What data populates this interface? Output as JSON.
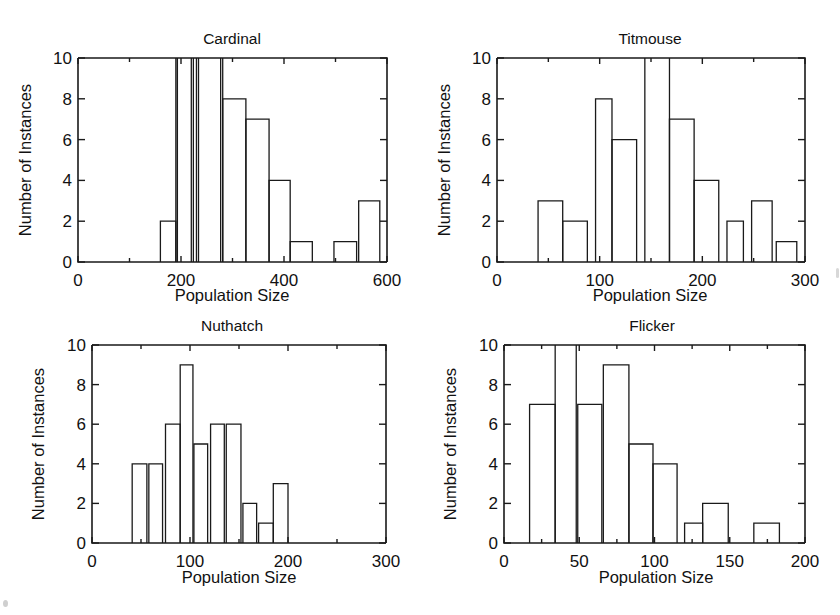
{
  "figure": {
    "background": "#ffffff",
    "ink_color": "#1a1a1a",
    "panel_count": 4,
    "layout": "2x2 grid of histograms"
  },
  "common": {
    "xlabel": "Population Size",
    "ylabel": "Number of Instances",
    "y_ticks": [
      "0",
      "2",
      "4",
      "6",
      "8",
      "10"
    ],
    "y_tick_values": [
      0,
      2,
      4,
      6,
      8,
      10
    ],
    "ylim": [
      0,
      10
    ]
  },
  "panels": [
    {
      "id": "cardinal",
      "title": "Cardinal",
      "x_ticks": [
        "0",
        "200",
        "400",
        "600"
      ],
      "x_tick_values": [
        0,
        200,
        400,
        600
      ]
    },
    {
      "id": "titmouse",
      "title": "Titmouse",
      "x_ticks": [
        "0",
        "100",
        "200",
        "300"
      ],
      "x_tick_values": [
        0,
        100,
        200,
        300
      ]
    },
    {
      "id": "nuthatch",
      "title": "Nuthatch",
      "x_ticks": [
        "0",
        "100",
        "200",
        "300"
      ],
      "x_tick_values": [
        0,
        100,
        200,
        300
      ]
    },
    {
      "id": "flicker",
      "title": "Flicker",
      "x_ticks": [
        "0",
        "50",
        "100",
        "150",
        "200"
      ],
      "x_tick_values": [
        0,
        50,
        100,
        150,
        200
      ]
    }
  ],
  "chart_data": [
    {
      "type": "bar",
      "id": "cardinal",
      "title": "Cardinal",
      "xlabel": "Population Size",
      "ylabel": "Number of Instances",
      "xlim": [
        0,
        600
      ],
      "ylim": [
        0,
        10
      ],
      "grid": false,
      "legend": null,
      "note": "Histogram; several bars exceed the y-axis limit of 10 and are clipped at the top of the axes.",
      "bin_edges": [
        160,
        190,
        220,
        230,
        250,
        280,
        310,
        340,
        370,
        400,
        430,
        460,
        520,
        550,
        580
      ],
      "bars": [
        {
          "x0": 160,
          "x1": 190,
          "value": 2,
          "clipped": false
        },
        {
          "x0": 190,
          "x1": 193,
          "value": 10,
          "clipped": true
        },
        {
          "x0": 220,
          "x1": 224,
          "value": 10,
          "clipped": true
        },
        {
          "x0": 230,
          "x1": 234,
          "value": 10,
          "clipped": true
        },
        {
          "x0": 277,
          "x1": 281,
          "value": 10,
          "clipped": true
        },
        {
          "x0": 281,
          "x1": 326,
          "value": 8,
          "clipped": false
        },
        {
          "x0": 326,
          "x1": 371,
          "value": 7,
          "clipped": false
        },
        {
          "x0": 371,
          "x1": 412,
          "value": 4,
          "clipped": false
        },
        {
          "x0": 412,
          "x1": 455,
          "value": 1,
          "clipped": false
        },
        {
          "x0": 497,
          "x1": 541,
          "value": 1,
          "clipped": false
        },
        {
          "x0": 545,
          "x1": 586,
          "value": 3,
          "clipped": false
        }
      ]
    },
    {
      "type": "bar",
      "id": "titmouse",
      "title": "Titmouse",
      "xlabel": "Population Size",
      "ylabel": "Number of Instances",
      "xlim": [
        0,
        300
      ],
      "ylim": [
        0,
        10
      ],
      "grid": false,
      "legend": null,
      "note": "Histogram; one bar exceeds the y-axis limit of 10 and is clipped at the top of the axes.",
      "bars": [
        {
          "x0": 40,
          "x1": 64,
          "value": 3,
          "clipped": false
        },
        {
          "x0": 64,
          "x1": 88,
          "value": 2,
          "clipped": false
        },
        {
          "x0": 96,
          "x1": 112,
          "value": 8,
          "clipped": false
        },
        {
          "x0": 112,
          "x1": 136,
          "value": 6,
          "clipped": false
        },
        {
          "x0": 144,
          "x1": 168,
          "value": 10,
          "clipped": true
        },
        {
          "x0": 168,
          "x1": 192,
          "value": 7,
          "clipped": false
        },
        {
          "x0": 192,
          "x1": 216,
          "value": 4,
          "clipped": false
        },
        {
          "x0": 224,
          "x1": 240,
          "value": 2,
          "clipped": false
        },
        {
          "x0": 248,
          "x1": 268,
          "value": 3,
          "clipped": false
        },
        {
          "x0": 272,
          "x1": 292,
          "value": 1,
          "clipped": false
        }
      ]
    },
    {
      "type": "bar",
      "id": "nuthatch",
      "title": "Nuthatch",
      "xlabel": "Population Size",
      "ylabel": "Number of Instances",
      "xlim": [
        0,
        300
      ],
      "ylim": [
        0,
        10
      ],
      "grid": false,
      "legend": null,
      "note": "Histogram; no bars are clipped.",
      "bars": [
        {
          "x0": 41,
          "x1": 56,
          "value": 4,
          "clipped": false
        },
        {
          "x0": 58,
          "x1": 72,
          "value": 4,
          "clipped": false
        },
        {
          "x0": 75,
          "x1": 90,
          "value": 6,
          "clipped": false
        },
        {
          "x0": 90,
          "x1": 103,
          "value": 9,
          "clipped": false
        },
        {
          "x0": 104,
          "x1": 118,
          "value": 5,
          "clipped": false
        },
        {
          "x0": 121,
          "x1": 135,
          "value": 6,
          "clipped": false
        },
        {
          "x0": 137,
          "x1": 152,
          "value": 6,
          "clipped": false
        },
        {
          "x0": 154,
          "x1": 168,
          "value": 2,
          "clipped": false
        },
        {
          "x0": 170,
          "x1": 185,
          "value": 1,
          "clipped": false
        },
        {
          "x0": 185,
          "x1": 200,
          "value": 3,
          "clipped": false
        }
      ]
    },
    {
      "type": "bar",
      "id": "flicker",
      "title": "Flicker",
      "xlabel": "Population Size",
      "ylabel": "Number of Instances",
      "xlim": [
        0,
        200
      ],
      "ylim": [
        0,
        10
      ],
      "grid": false,
      "legend": null,
      "note": "Histogram; one bar exceeds the y-axis limit of 10 and is clipped at the top of the axes.",
      "bars": [
        {
          "x0": 17,
          "x1": 34,
          "value": 7,
          "clipped": false
        },
        {
          "x0": 34,
          "x1": 48,
          "value": 10,
          "clipped": true
        },
        {
          "x0": 49,
          "x1": 65,
          "value": 7,
          "clipped": false
        },
        {
          "x0": 66,
          "x1": 83,
          "value": 9,
          "clipped": false
        },
        {
          "x0": 83,
          "x1": 99,
          "value": 5,
          "clipped": false
        },
        {
          "x0": 99,
          "x1": 115,
          "value": 4,
          "clipped": false
        },
        {
          "x0": 120,
          "x1": 132,
          "value": 1,
          "clipped": false
        },
        {
          "x0": 132,
          "x1": 149,
          "value": 2,
          "clipped": false
        },
        {
          "x0": 166,
          "x1": 183,
          "value": 1,
          "clipped": false
        }
      ]
    }
  ]
}
